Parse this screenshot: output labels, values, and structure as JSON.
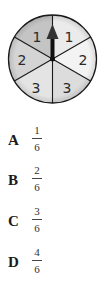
{
  "spinner": {
    "sections": [
      {
        "label": "1",
        "position": "top-left",
        "fill": "#c8c8c8"
      },
      {
        "label": "1",
        "position": "top-right",
        "fill": "#ececec"
      },
      {
        "label": "2",
        "position": "right",
        "fill": "#f2f2f2"
      },
      {
        "label": "3",
        "position": "bottom-right",
        "fill": "#dedede"
      },
      {
        "label": "3",
        "position": "bottom-left",
        "fill": "#e6e6e6"
      },
      {
        "label": "2",
        "position": "left",
        "fill": "#d6d6d6"
      }
    ],
    "arrow": "pointing-up"
  },
  "options": [
    {
      "letter": "A",
      "numerator": "1",
      "denominator": "6"
    },
    {
      "letter": "B",
      "numerator": "2",
      "denominator": "6"
    },
    {
      "letter": "C",
      "numerator": "3",
      "denominator": "6"
    },
    {
      "letter": "D",
      "numerator": "4",
      "denominator": "6"
    }
  ]
}
